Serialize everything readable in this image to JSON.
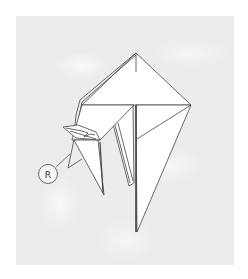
{
  "diagram": {
    "type": "origami-fold-step",
    "background_color": "#ececec",
    "paper_color": "#ffffff",
    "line_color": "#444444",
    "annotations": [
      {
        "id": "reference-marker",
        "label": "R"
      }
    ]
  }
}
